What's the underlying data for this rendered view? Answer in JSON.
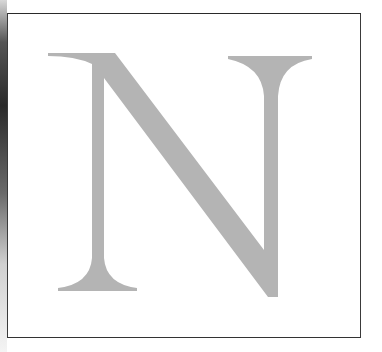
{
  "figure": {
    "letter": "N",
    "fill_color": "#b4b4b4",
    "frame_color": "#3a3a3a",
    "background": "#ffffff"
  }
}
